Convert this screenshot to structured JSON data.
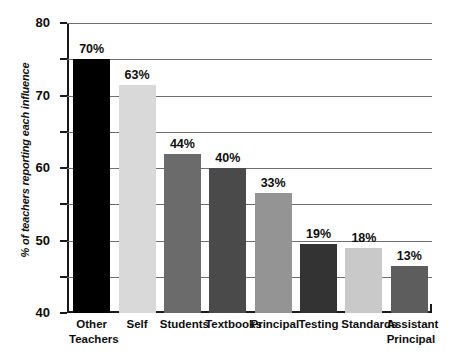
{
  "chart_data": {
    "type": "bar",
    "title": "",
    "xlabel": "",
    "ylabel": "% of teachers reporting each influence",
    "ylim": [
      0,
      80
    ],
    "ytick_step": 10,
    "yticks": [
      "80",
      "70",
      "60",
      "50",
      "40",
      "30",
      "20",
      "10",
      "0"
    ],
    "grid": true,
    "legend": false,
    "categories": [
      "Other Teachers",
      "Self",
      "Students",
      "Textbooks",
      "Principal",
      "Testing",
      "Standards",
      "Assistant Principal"
    ],
    "values": [
      70,
      63,
      44,
      40,
      33,
      19,
      18,
      13
    ],
    "value_labels": [
      "70%",
      "63%",
      "44%",
      "40%",
      "33%",
      "19%",
      "18%",
      "13%"
    ],
    "bar_colors": [
      "#000000",
      "#d9d9d9",
      "#6b6b6b",
      "#4a4a4a",
      "#949494",
      "#333333",
      "#c9c9c9",
      "#5d5d5d"
    ],
    "category_lines": [
      [
        "Other",
        "Teachers"
      ],
      [
        "Self"
      ],
      [
        "Students"
      ],
      [
        "Textbooks"
      ],
      [
        "Principal"
      ],
      [
        "Testing"
      ],
      [
        "Standards"
      ],
      [
        "Assistant",
        "Principal"
      ]
    ],
    "axis_color": "#1a1a1a",
    "grid_color": "#6e6e6e",
    "background": "#ffffff"
  }
}
